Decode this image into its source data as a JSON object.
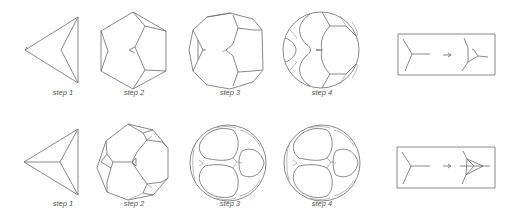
{
  "rows": [
    {
      "id": "row-1",
      "steps": [
        {
          "label": "step 1",
          "x": 63,
          "y": 92
        },
        {
          "label": "step 2",
          "x": 134,
          "y": 92
        },
        {
          "label": "step 3",
          "x": 230,
          "y": 92
        },
        {
          "label": "step 4",
          "x": 322,
          "y": 92
        }
      ],
      "rule": {
        "description": "vertex replaced by vertex with small triangle hint",
        "arrow": "→"
      }
    },
    {
      "id": "row-2",
      "steps": [
        {
          "label": "step 1",
          "x": 63,
          "y": 203
        },
        {
          "label": "step 2",
          "x": 134,
          "y": 203
        },
        {
          "label": "step 3",
          "x": 230,
          "y": 203
        },
        {
          "label": "step 4",
          "x": 322,
          "y": 203
        }
      ],
      "rule": {
        "description": "vertex replaced by triangle",
        "arrow": "→"
      }
    }
  ],
  "colors": {
    "stroke": "#6a6a6a",
    "text": "#555555",
    "background": "#ffffff"
  }
}
